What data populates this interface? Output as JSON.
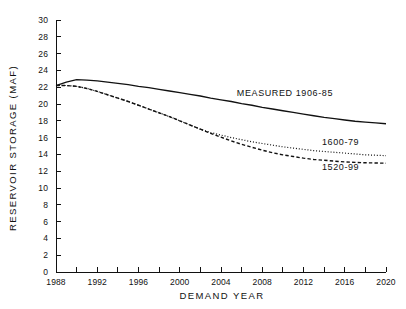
{
  "chart_data": {
    "type": "line",
    "title": "",
    "xlabel": "DEMAND YEAR",
    "ylabel": "RESERVOIR STORAGE (MAF)",
    "xlim": [
      1988,
      2020
    ],
    "ylim": [
      0,
      30
    ],
    "xticks": [
      1988,
      1990,
      1992,
      1994,
      1996,
      1998,
      2000,
      2002,
      2004,
      2006,
      2008,
      2010,
      2012,
      2014,
      2016,
      2018,
      2020
    ],
    "xtick_labels": [
      "1988",
      "",
      "1992",
      "",
      "1996",
      "",
      "2000",
      "",
      "2004",
      "",
      "2008",
      "",
      "2012",
      "",
      "2016",
      "",
      "2020"
    ],
    "yticks": [
      0,
      2,
      4,
      6,
      8,
      10,
      12,
      14,
      16,
      18,
      20,
      22,
      24,
      26,
      28,
      30
    ],
    "ytick_labels": [
      "0",
      "2",
      "4",
      "6",
      "8",
      "10",
      "12",
      "14",
      "16",
      "18",
      "20",
      "22",
      "24",
      "26",
      "28",
      "30"
    ],
    "grid": false,
    "legend_position": "inline-annotations",
    "x": [
      1988,
      1989,
      1990,
      1991,
      1992,
      1993,
      1994,
      1995,
      1996,
      1997,
      1998,
      1999,
      2000,
      2001,
      2002,
      2003,
      2004,
      2005,
      2006,
      2007,
      2008,
      2009,
      2010,
      2011,
      2012,
      2013,
      2014,
      2015,
      2016,
      2017,
      2018,
      2019,
      2020
    ],
    "series": [
      {
        "name": "MEASURED 1906-85",
        "style": "solid",
        "color": "#111111",
        "values": [
          22.2,
          22.6,
          22.9,
          22.85,
          22.75,
          22.6,
          22.45,
          22.3,
          22.1,
          21.95,
          21.75,
          21.55,
          21.35,
          21.15,
          20.95,
          20.7,
          20.5,
          20.3,
          20.05,
          19.85,
          19.6,
          19.4,
          19.2,
          19.0,
          18.8,
          18.6,
          18.4,
          18.25,
          18.1,
          17.95,
          17.85,
          17.75,
          17.65
        ]
      },
      {
        "name": "1600-79",
        "style": "dotted",
        "color": "#111111",
        "values": [
          22.2,
          22.2,
          22.1,
          21.85,
          21.5,
          21.1,
          20.7,
          20.3,
          19.85,
          19.4,
          18.95,
          18.5,
          18.0,
          17.5,
          17.0,
          16.6,
          16.3,
          16.0,
          15.75,
          15.5,
          15.3,
          15.1,
          14.9,
          14.75,
          14.6,
          14.45,
          14.35,
          14.25,
          14.15,
          14.05,
          13.95,
          13.9,
          13.85
        ]
      },
      {
        "name": "1520-99",
        "style": "dashed",
        "color": "#111111",
        "values": [
          22.2,
          22.2,
          22.1,
          21.85,
          21.5,
          21.1,
          20.7,
          20.3,
          19.85,
          19.4,
          18.95,
          18.5,
          18.0,
          17.5,
          17.0,
          16.5,
          16.05,
          15.6,
          15.2,
          14.85,
          14.5,
          14.2,
          13.95,
          13.75,
          13.55,
          13.4,
          13.3,
          13.2,
          13.1,
          13.05,
          13.0,
          12.98,
          12.95
        ]
      }
    ],
    "annotations": [
      {
        "text": "MEASURED 1906-85",
        "x": 2010.2,
        "y": 21.0,
        "name": "measured-series-label"
      },
      {
        "text": "1600-79",
        "x": 2015.6,
        "y": 15.1,
        "name": "dotted-series-label"
      },
      {
        "text": "1520-99",
        "x": 2015.6,
        "y": 12.1,
        "name": "dashed-series-label"
      }
    ]
  }
}
